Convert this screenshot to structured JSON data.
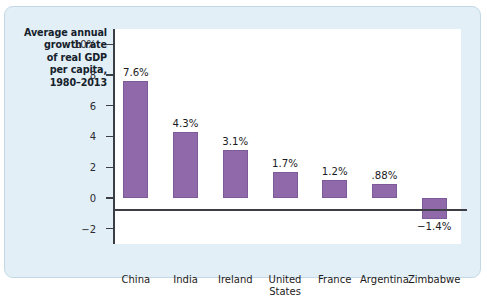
{
  "figure": {
    "axis_title_lines": [
      "Average annual",
      "growth rate",
      "of real GDP",
      "per capita,",
      "1980–2013"
    ],
    "colors": {
      "bar_fill": "#9069ab",
      "bar_stroke": "#7d5a98",
      "panel_background": "#e3eff6",
      "panel_border": "#c3d8e4",
      "plot_background": "#ffffff",
      "axis_line": "#3d3d45",
      "text": "#1b1b22"
    }
  },
  "chart_data": {
    "type": "bar",
    "title": "Average annual growth rate of real GDP per capita, 1980–2013",
    "xlabel": "",
    "ylabel": "Average annual growth rate of real GDP per capita, 1980–2013",
    "categories": [
      "China",
      "India",
      "Ireland",
      "United States",
      "France",
      "Argentina",
      "Zimbabwe"
    ],
    "category_label_lines": [
      [
        "China"
      ],
      [
        "India"
      ],
      [
        "Ireland"
      ],
      [
        "United",
        "States"
      ],
      [
        "France"
      ],
      [
        "Argentina"
      ],
      [
        "Zimbabwe"
      ]
    ],
    "values": [
      7.6,
      4.3,
      3.1,
      1.7,
      1.2,
      0.88,
      -1.4
    ],
    "data_labels": [
      "7.6%",
      "4.3%",
      "3.1%",
      "1.7%",
      "1.2%",
      ".88%",
      "−1.4%"
    ],
    "ylim": [
      -3,
      11
    ],
    "yticks": [
      10,
      8,
      6,
      4,
      2,
      0,
      -2
    ],
    "ytick_labels": [
      "10%",
      "8",
      "6",
      "4",
      "2",
      "0",
      "−2"
    ],
    "grid": false,
    "legend": false,
    "units": "percent"
  }
}
